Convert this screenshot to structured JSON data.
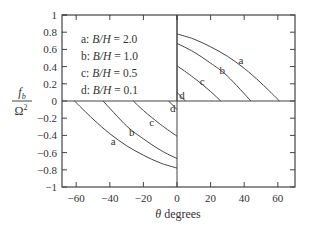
{
  "chart_data": {
    "type": "line",
    "title": "",
    "xlabel": "θ degrees",
    "ylabel_numerator": "f_b",
    "ylabel_denominator": "Ω²",
    "xlim": [
      -70,
      70
    ],
    "ylim": [
      -1,
      1
    ],
    "x_ticks": [
      -60,
      -40,
      -20,
      0,
      20,
      40,
      60
    ],
    "x_tick_labels": [
      "−60",
      "−40",
      "−20",
      "0",
      "20",
      "40",
      "60"
    ],
    "y_ticks": [
      -1,
      -0.8,
      -0.6,
      -0.4,
      -0.2,
      0,
      0.2,
      0.4,
      0.6,
      0.8,
      1
    ],
    "y_tick_labels": [
      "−1",
      "−0.8",
      "−0.6",
      "−0.4",
      "−0.2",
      "0",
      "0.2",
      "0.4",
      "0.6",
      "0.8",
      "1"
    ],
    "grid": false,
    "legend_position": "upper-left inset box",
    "legend": [
      {
        "key": "a",
        "text": "a: B/H = 2.0"
      },
      {
        "key": "b",
        "text": "b: B/H = 1.0"
      },
      {
        "key": "c",
        "text": "c: B/H = 0.5"
      },
      {
        "key": "d",
        "text": "d: B/H = 0.1"
      }
    ],
    "series": [
      {
        "name": "a",
        "label": "B/H = 2.0",
        "x": [
          0,
          10,
          20,
          30,
          40,
          50,
          61
        ],
        "y": [
          0.78,
          0.72,
          0.63,
          0.52,
          0.38,
          0.21,
          0.0
        ]
      },
      {
        "name": "b",
        "label": "B/H = 1.0",
        "x": [
          0,
          10,
          20,
          30,
          44
        ],
        "y": [
          0.67,
          0.57,
          0.44,
          0.29,
          0.0
        ]
      },
      {
        "name": "c",
        "label": "B/H = 0.5",
        "x": [
          0,
          10,
          20,
          26
        ],
        "y": [
          0.41,
          0.27,
          0.11,
          0.0
        ]
      },
      {
        "name": "d",
        "label": "B/H = 0.1",
        "x": [
          0,
          5
        ],
        "y": [
          0.1,
          0.0
        ]
      }
    ],
    "symmetry": "curves mirrored through origin: f(-θ) = -f(θ)",
    "curve_labels": [
      {
        "text": "a",
        "x": 38,
        "y": 0.48
      },
      {
        "text": "b",
        "x": 27,
        "y": 0.36
      },
      {
        "text": "c",
        "x": 15,
        "y": 0.23
      },
      {
        "text": "d",
        "x": 3,
        "y": 0.07
      },
      {
        "text": "a",
        "x": -38,
        "y": -0.47
      },
      {
        "text": "b",
        "x": -27,
        "y": -0.36
      },
      {
        "text": "c",
        "x": -15,
        "y": -0.24
      },
      {
        "text": "d",
        "x": -2.5,
        "y": -0.08
      }
    ]
  }
}
